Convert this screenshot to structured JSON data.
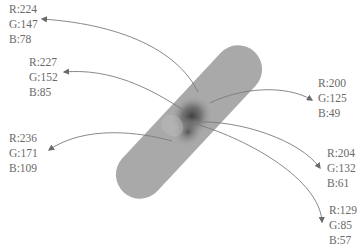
{
  "figure": {
    "background": "#ffffff",
    "bandage": {
      "fill": "#a8a8a8",
      "shadow": "#3f3f3f"
    },
    "annotations": [
      {
        "id": "a1",
        "r": "R:224",
        "g": "G:147",
        "b": "B:78"
      },
      {
        "id": "a2",
        "r": "R:227",
        "g": "G:152",
        "b": "B:85"
      },
      {
        "id": "a3",
        "r": "R:236",
        "g": "G:171",
        "b": "B:109"
      },
      {
        "id": "a4",
        "r": "R:200",
        "g": "G:125",
        "b": "B:49"
      },
      {
        "id": "a5",
        "r": "R:204",
        "g": "G:132",
        "b": "B:61"
      },
      {
        "id": "a6",
        "r": "R:129",
        "g": "G:85",
        "b": "B:57"
      }
    ]
  }
}
